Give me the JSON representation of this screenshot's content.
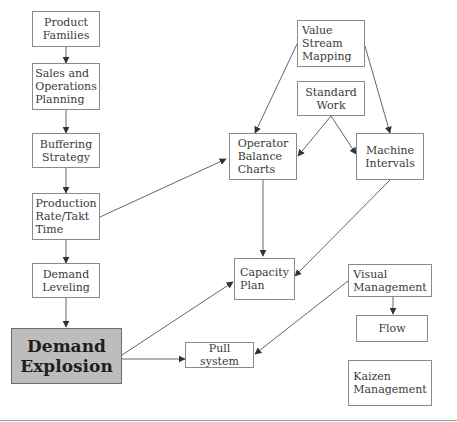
{
  "diagram": {
    "colors": {
      "line": "#555555",
      "border": "#8a8a8a",
      "highlight_fill": "#bdbdbd"
    },
    "nodes": {
      "product_families": "Product\nFamilies",
      "sales_ops_planning": "Sales and\nOperations\nPlanning",
      "buffering_strategy": "Buffering\nStrategy",
      "production_rate": "Production\nRate/Takt\nTime",
      "demand_leveling": "Demand\nLeveling",
      "demand_explosion": "Demand\nExplosion",
      "value_stream_mapping": "Value Stream\nMapping",
      "standard_work": "Standard\nWork",
      "operator_balance_charts": "Operator\nBalance\nCharts",
      "machine_intervals": "Machine\nIntervals",
      "capacity_plan": "Capacity\nPlan",
      "visual_management": "Visual\nManagement",
      "flow": "Flow",
      "pull_system": "Pull system",
      "kaizen_management": "Kaizen\nManagement"
    },
    "edges": [
      [
        "product_families",
        "sales_ops_planning"
      ],
      [
        "sales_ops_planning",
        "buffering_strategy"
      ],
      [
        "buffering_strategy",
        "production_rate"
      ],
      [
        "production_rate",
        "demand_leveling"
      ],
      [
        "demand_leveling",
        "demand_explosion"
      ],
      [
        "production_rate",
        "operator_balance_charts"
      ],
      [
        "value_stream_mapping",
        "operator_balance_charts"
      ],
      [
        "value_stream_mapping",
        "machine_intervals"
      ],
      [
        "standard_work",
        "operator_balance_charts"
      ],
      [
        "standard_work",
        "machine_intervals"
      ],
      [
        "operator_balance_charts",
        "capacity_plan"
      ],
      [
        "machine_intervals",
        "capacity_plan"
      ],
      [
        "demand_explosion",
        "capacity_plan"
      ],
      [
        "demand_explosion",
        "pull_system"
      ],
      [
        "visual_management",
        "pull_system"
      ],
      [
        "visual_management",
        "flow"
      ]
    ]
  }
}
